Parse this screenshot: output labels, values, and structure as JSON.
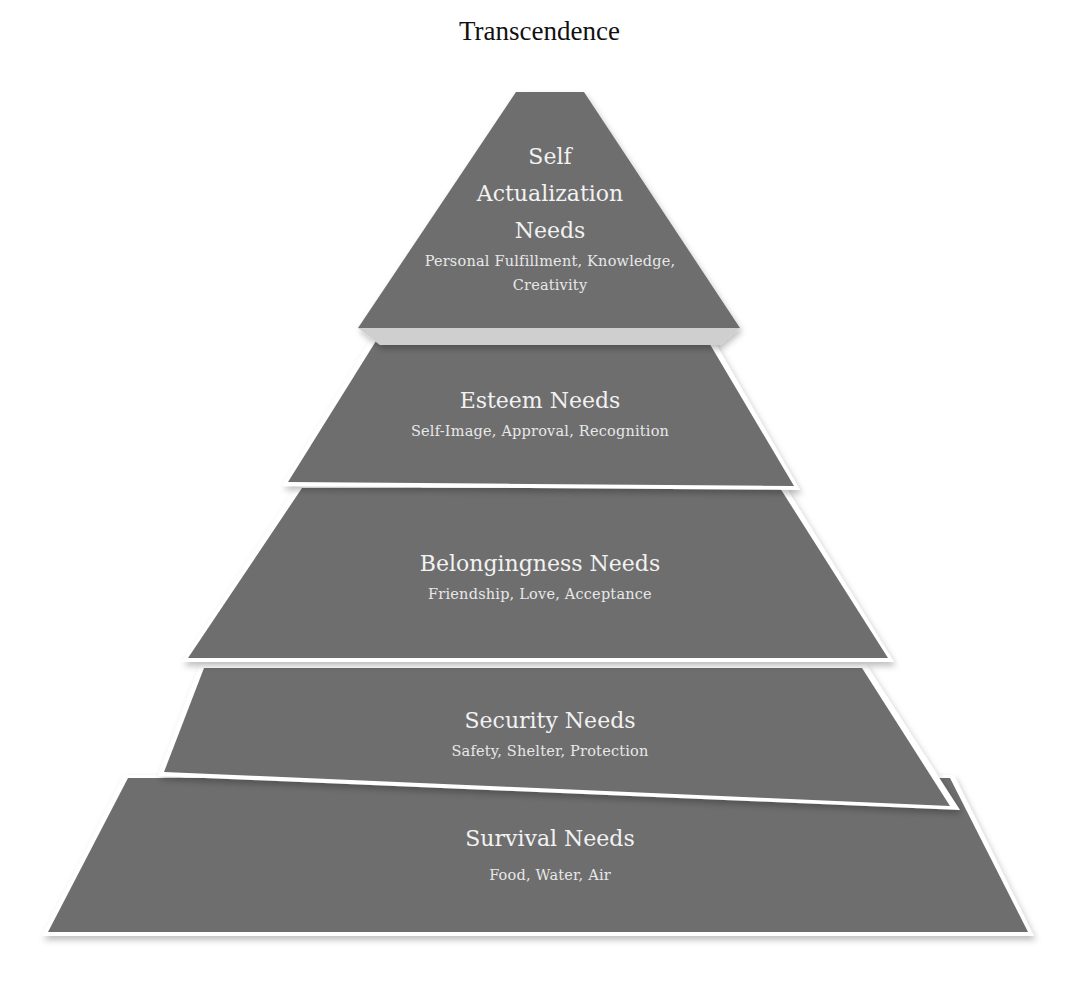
{
  "apex_label": "Transcendence",
  "colors": {
    "tier_fill": "#6e6e6e",
    "tier_text": "#f2f2f2",
    "background": "#ffffff",
    "apex_text": "#111111"
  },
  "tiers": [
    {
      "level": 5,
      "title_lines": [
        "Self",
        "Actualization",
        "Needs"
      ],
      "subtitle_lines": [
        "Personal Fulfillment, Knowledge,",
        "Creativity"
      ]
    },
    {
      "level": 4,
      "title": "Esteem Needs",
      "subtitle": "Self-Image, Approval, Recognition"
    },
    {
      "level": 3,
      "title": "Belongingness Needs",
      "subtitle": "Friendship, Love, Acceptance"
    },
    {
      "level": 2,
      "title": "Security Needs",
      "subtitle": "Safety, Shelter, Protection"
    },
    {
      "level": 1,
      "title": "Survival Needs",
      "subtitle": "Food, Water, Air"
    }
  ]
}
